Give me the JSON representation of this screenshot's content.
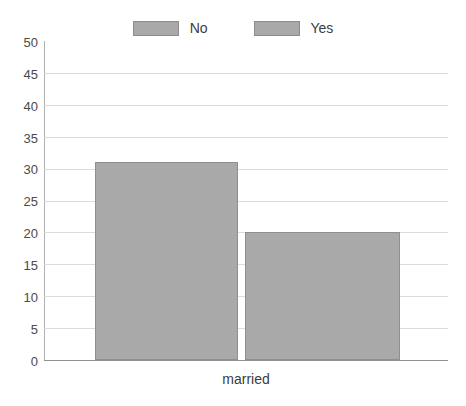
{
  "chart_data": {
    "type": "bar",
    "title": "",
    "subtitle": "",
    "xlabel": "married",
    "ylabel": "",
    "categories": [
      "married"
    ],
    "series": [
      {
        "name": "No",
        "values": [
          31
        ]
      },
      {
        "name": "Yes",
        "values": [
          20
        ]
      }
    ],
    "ylim": [
      0,
      50
    ],
    "ytick_values": [
      0,
      5,
      10,
      15,
      20,
      25,
      30,
      35,
      40,
      45,
      50
    ],
    "ytick_labels": [
      "0",
      "5",
      "10",
      "15",
      "20",
      "25",
      "30",
      "35",
      "40",
      "45",
      "50"
    ],
    "gridline_values": [
      5,
      10,
      15,
      20,
      25,
      30,
      35,
      40,
      45
    ],
    "grid": true,
    "legend_position": "top-center",
    "legend": [
      {
        "label": "No",
        "color": "#a9a9a9"
      },
      {
        "label": "Yes",
        "color": "#a9a9a9"
      }
    ],
    "bar_fill_color": "#a9a9a9",
    "bar_border_color": "#8f8f8f",
    "gridline_color": "#dcdcdc",
    "axis_color": "#909090",
    "background_color": "#ffffff",
    "text_color": "#3c3c3c"
  },
  "legend": {
    "items": [
      {
        "label": "No"
      },
      {
        "label": "Yes"
      }
    ]
  },
  "axes": {
    "x_label": "married",
    "y_ticks": [
      "50",
      "45",
      "40",
      "35",
      "30",
      "25",
      "20",
      "15",
      "10",
      "5",
      "0"
    ]
  }
}
